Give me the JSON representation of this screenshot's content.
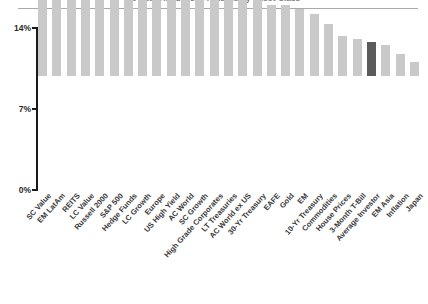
{
  "figure": {
    "title": "20-Year Annualized Returns by Asset Class",
    "divider": "header-rule"
  },
  "axis": {
    "y_ticks": [
      "14%",
      "7%",
      "0%"
    ],
    "y_unit": "%"
  },
  "colors": {
    "bar_default": "#c9c9c9",
    "bar_highlight": "#5b5b5b",
    "axis": "#1a1a1a",
    "text": "#3a3a3a",
    "rule": "#a9a9a9"
  },
  "chart_data": {
    "type": "bar",
    "title": "20-Year Annualized Returns by Asset Class",
    "xlabel": "",
    "ylabel": "",
    "ylim": [
      0,
      14
    ],
    "yticks": [
      0,
      7,
      14
    ],
    "ytick_labels": [
      "0%",
      "7%",
      "14%"
    ],
    "grid": false,
    "legend": "none",
    "orientation": "vertical",
    "sorted": "descending",
    "highlight_category": "Average Investor",
    "highlight_color": "#5b5b5b",
    "default_color": "#c9c9c9",
    "categories": [
      "SC Value",
      "EM LatAm",
      "REITS",
      "LC Value",
      "Russell 2000",
      "S&P 500",
      "Hedge Funds",
      "LC Growth",
      "Europe",
      "US High Yield",
      "AC World",
      "SC Growth",
      "High Grade Corporates",
      "LT Treasuries",
      "AC World ex US",
      "30-Yr Treasury",
      "EAFE",
      "Gold",
      "EM",
      "10-Yr Treasury",
      "Commodities",
      "House Prices",
      "3-Month T-Bill",
      "Average Investor",
      "EM Asia",
      "Inflation",
      "Japan"
    ],
    "values": [
      11.8,
      11.1,
      10.4,
      10.4,
      9.7,
      9.7,
      8.9,
      8.9,
      8.2,
      8.2,
      7.6,
      7.6,
      7.0,
      7.0,
      6.6,
      6.6,
      6.1,
      6.1,
      5.8,
      5.4,
      4.5,
      3.5,
      3.2,
      2.9,
      2.7,
      1.9,
      1.2
    ]
  }
}
